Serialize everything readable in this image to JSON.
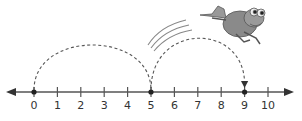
{
  "diagram": {
    "type": "number-line-jumps",
    "number_line": {
      "min": 0,
      "max": 10,
      "ticks": [
        "0",
        "1",
        "2",
        "3",
        "4",
        "5",
        "6",
        "7",
        "8",
        "9",
        "10"
      ],
      "marked_points": [
        0,
        5,
        9
      ],
      "arrows": "both-ends"
    },
    "jumps": [
      {
        "from": 0,
        "to": 5,
        "style": "dashed-arc"
      },
      {
        "from": 5,
        "to": 9,
        "style": "dashed-arc-with-arrow"
      }
    ],
    "illustration": "frog-jumping",
    "colors": {
      "line": "#555555",
      "frog": "#8a8a8a",
      "text": "#333333"
    }
  }
}
